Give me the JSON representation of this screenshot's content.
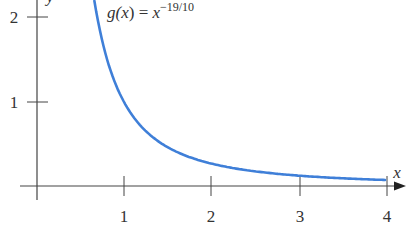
{
  "chart_data": {
    "type": "line",
    "title": "",
    "function_label": {
      "name": "g",
      "arg": "x",
      "equals": "=",
      "base": "x",
      "exponent": "−19/10"
    },
    "xlabel": "x",
    "ylabel": "y",
    "xlim": [
      0,
      4
    ],
    "ylim": [
      0,
      2.2
    ],
    "x_ticks": [
      1,
      2,
      3,
      4
    ],
    "x_tick_labels": [
      "1",
      "2",
      "3",
      "4"
    ],
    "y_ticks": [
      1,
      2
    ],
    "y_tick_labels": [
      "1",
      "2"
    ],
    "grid": false,
    "legend": null,
    "series": [
      {
        "name": "g(x) = x^(-19/10)",
        "color": "#3f7fd8",
        "x": [
          0.66,
          0.7,
          0.75,
          0.8,
          0.9,
          1.0,
          1.2,
          1.4,
          1.6,
          1.8,
          2.0,
          2.5,
          3.0,
          3.5,
          4.0
        ],
        "y": [
          2.2,
          1.97,
          1.73,
          1.53,
          1.22,
          1.0,
          0.71,
          0.53,
          0.41,
          0.33,
          0.27,
          0.18,
          0.12,
          0.093,
          0.072
        ]
      }
    ]
  },
  "labels": {
    "x_axis": "x",
    "y_axis": "y",
    "tick_x1": "1",
    "tick_x2": "2",
    "tick_x3": "3",
    "tick_x4": "4",
    "tick_y1": "1",
    "tick_y2": "2",
    "formula_name": "g(",
    "formula_arg": "x",
    "formula_close": ") = ",
    "formula_base": "x",
    "formula_exp": "−19/10"
  }
}
